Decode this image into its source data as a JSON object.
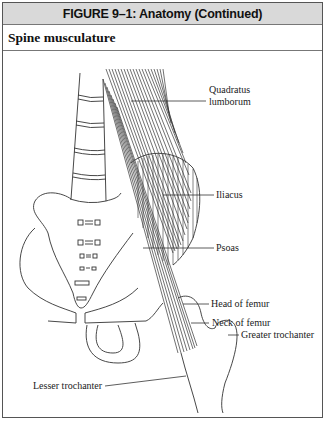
{
  "figure": {
    "title": "FIGURE 9–1: Anatomy (Continued)",
    "section_title": "Spine musculature"
  },
  "labels": {
    "quadratus_line1": "Quadratus",
    "quadratus_line2": "lumborum",
    "iliacus": "Iliacus",
    "psoas": "Psoas",
    "head_of_femur": "Head of femur",
    "neck_of_femur": "Neck of femur",
    "greater_trochanter": "Greater trochanter",
    "lesser_trochanter": "Lesser trochanter"
  },
  "colors": {
    "header_bg": "#d9d9d9",
    "line": "#333333",
    "border": "#555555"
  }
}
